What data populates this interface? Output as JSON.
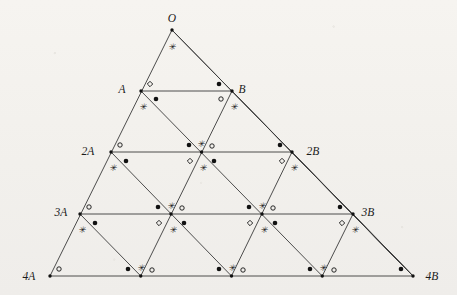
{
  "figure": {
    "name": "triangle-lattice-angle-diagram",
    "background_color": "#f4f2ee",
    "line_color": "#3a3a3a",
    "marker_color": "#111111",
    "width": 457,
    "height": 295
  },
  "labels": {
    "apex": "O",
    "row1_left": "A",
    "row1_right": "B",
    "row2_left": "2A",
    "row2_right": "2B",
    "row3_left": "3A",
    "row3_right": "3B",
    "row4_left": "4A",
    "row4_right": "4B"
  },
  "label_positions": [
    {
      "id": "O",
      "text": "O",
      "x": 172,
      "y": 22,
      "anchor": "middle"
    },
    {
      "id": "A",
      "text": "A",
      "x": 122,
      "y": 93,
      "anchor": "middle"
    },
    {
      "id": "B",
      "text": "B",
      "x": 242,
      "y": 93,
      "anchor": "middle"
    },
    {
      "id": "2A",
      "text": "2A",
      "x": 88,
      "y": 155,
      "anchor": "middle"
    },
    {
      "id": "2B",
      "text": "2B",
      "x": 313,
      "y": 155,
      "anchor": "middle"
    },
    {
      "id": "3A",
      "text": "3A",
      "x": 61,
      "y": 216,
      "anchor": "middle"
    },
    {
      "id": "3B",
      "text": "3B",
      "x": 368,
      "y": 216,
      "anchor": "middle"
    },
    {
      "id": "4A",
      "text": "4A",
      "x": 29,
      "y": 280,
      "anchor": "middle"
    },
    {
      "id": "4B",
      "text": "4B",
      "x": 432,
      "y": 280,
      "anchor": "middle"
    }
  ],
  "geometry": {
    "apex": {
      "x": 172,
      "y": 30
    },
    "rows": [
      {
        "index": 0,
        "y": 30,
        "left_x": 172,
        "right_x": 172,
        "nodes": 1
      },
      {
        "index": 1,
        "y": 91,
        "left_x": 141,
        "right_x": 232,
        "nodes": 2
      },
      {
        "index": 2,
        "y": 152,
        "left_x": 111,
        "right_x": 292,
        "nodes": 3
      },
      {
        "index": 3,
        "y": 214,
        "left_x": 80,
        "right_x": 353,
        "nodes": 4
      },
      {
        "index": 4,
        "y": 276,
        "left_x": 50,
        "right_x": 413,
        "nodes": 5
      }
    ],
    "row_count": 5,
    "subdivisions": 4
  },
  "lines": {
    "horizontal_count": 4,
    "left_diagonal_count": 4,
    "right_diagonal_count": 4,
    "outline": "triangle O-4A-4B"
  },
  "markers": {
    "filled_dot": "filled-dot-marker",
    "open_circle": "open-circle-marker",
    "open_diamond": "open-diamond-marker",
    "asterisk": "asterisk-marker",
    "vertex_dot": "vertex-dot-marker",
    "legend": {
      "filled_dot_meaning": "congruent angle set 1",
      "open_circle_meaning": "congruent angle set 2",
      "open_diamond_meaning": "congruent angle set 3",
      "asterisk_meaning": "congruent angle set 4"
    }
  },
  "marker_placements": [
    {
      "type": "asterisk",
      "x": 172,
      "y": 47
    },
    {
      "type": "open_diamond",
      "x": 150,
      "y": 84
    },
    {
      "type": "filled_dot",
      "x": 156,
      "y": 99
    },
    {
      "type": "asterisk",
      "x": 143,
      "y": 107
    },
    {
      "type": "filled_dot",
      "x": 219,
      "y": 84
    },
    {
      "type": "open_circle",
      "x": 221,
      "y": 99
    },
    {
      "type": "asterisk",
      "x": 234,
      "y": 107
    },
    {
      "type": "open_circle",
      "x": 120,
      "y": 145
    },
    {
      "type": "filled_dot",
      "x": 126,
      "y": 161
    },
    {
      "type": "asterisk",
      "x": 113,
      "y": 168
    },
    {
      "type": "filled_dot",
      "x": 189,
      "y": 145
    },
    {
      "type": "asterisk",
      "x": 201,
      "y": 144
    },
    {
      "type": "open_circle",
      "x": 212,
      "y": 146
    },
    {
      "type": "open_diamond",
      "x": 190,
      "y": 161
    },
    {
      "type": "filled_dot",
      "x": 214,
      "y": 161
    },
    {
      "type": "asterisk",
      "x": 203,
      "y": 168
    },
    {
      "type": "filled_dot",
      "x": 280,
      "y": 145
    },
    {
      "type": "open_diamond",
      "x": 282,
      "y": 161
    },
    {
      "type": "asterisk",
      "x": 294,
      "y": 168
    },
    {
      "type": "open_circle",
      "x": 89,
      "y": 207
    },
    {
      "type": "filled_dot",
      "x": 95,
      "y": 223
    },
    {
      "type": "asterisk",
      "x": 82,
      "y": 230
    },
    {
      "type": "filled_dot",
      "x": 158,
      "y": 207
    },
    {
      "type": "asterisk",
      "x": 171,
      "y": 206
    },
    {
      "type": "open_circle",
      "x": 182,
      "y": 208
    },
    {
      "type": "open_diamond",
      "x": 159,
      "y": 223
    },
    {
      "type": "filled_dot",
      "x": 184,
      "y": 223
    },
    {
      "type": "asterisk",
      "x": 173,
      "y": 230
    },
    {
      "type": "filled_dot",
      "x": 249,
      "y": 207
    },
    {
      "type": "asterisk",
      "x": 262,
      "y": 206
    },
    {
      "type": "open_circle",
      "x": 273,
      "y": 208
    },
    {
      "type": "open_diamond",
      "x": 250,
      "y": 223
    },
    {
      "type": "filled_dot",
      "x": 275,
      "y": 223
    },
    {
      "type": "asterisk",
      "x": 264,
      "y": 230
    },
    {
      "type": "filled_dot",
      "x": 340,
      "y": 207
    },
    {
      "type": "open_diamond",
      "x": 342,
      "y": 223
    },
    {
      "type": "asterisk",
      "x": 355,
      "y": 230
    },
    {
      "type": "open_circle",
      "x": 59,
      "y": 269
    },
    {
      "type": "filled_dot",
      "x": 128,
      "y": 269
    },
    {
      "type": "asterisk",
      "x": 141,
      "y": 268
    },
    {
      "type": "open_circle",
      "x": 152,
      "y": 270
    },
    {
      "type": "filled_dot",
      "x": 219,
      "y": 269
    },
    {
      "type": "asterisk",
      "x": 232,
      "y": 268
    },
    {
      "type": "open_circle",
      "x": 243,
      "y": 270
    },
    {
      "type": "filled_dot",
      "x": 310,
      "y": 269
    },
    {
      "type": "asterisk",
      "x": 323,
      "y": 268
    },
    {
      "type": "open_circle",
      "x": 334,
      "y": 270
    },
    {
      "type": "filled_dot",
      "x": 401,
      "y": 269
    }
  ]
}
